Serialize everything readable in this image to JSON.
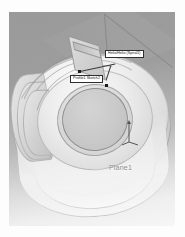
{
  "app": {
    "type": "cad-3d-viewport",
    "background_color": "#ffffff",
    "viewport_gradient_top": "#9a9a9a",
    "viewport_gradient_bottom": "#f6f6f6"
  },
  "model": {
    "description": "spiral volute solid with central bore",
    "body_color": "#dcdcdc",
    "edge_color": "#969696"
  },
  "callouts": [
    {
      "id": "helix",
      "label": "Helix/Helix (Spiral1)",
      "box_fill": "#ffffff",
      "box_border": "#2e2e2e",
      "text_color": "#111111"
    },
    {
      "id": "profile",
      "label": "Profile1 Sketch2",
      "box_fill": "#ffffff",
      "box_border": "#2e2e2e",
      "text_color": "#111111"
    }
  ],
  "plane": {
    "label": "Plane1",
    "text_color": "#8d8d8d"
  },
  "triad": {
    "name": "origin-axis-triad",
    "axis_color": "#555555",
    "axes": [
      "y-axis-arrow",
      "x-axis",
      "z-axis"
    ]
  }
}
